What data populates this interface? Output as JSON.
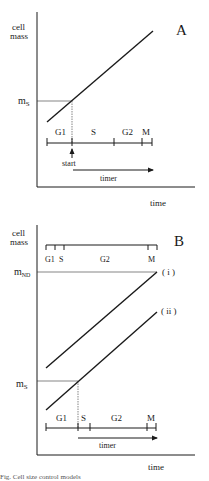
{
  "figure": {
    "panel_a": {
      "label": "A",
      "y_axis_label_line1": "cell",
      "y_axis_label_line2": "mass",
      "x_axis_label": "time",
      "threshold_label": "m",
      "threshold_subscript": "S",
      "phases": [
        "G1",
        "S",
        "G2",
        "M"
      ],
      "start_label": "start",
      "timer_label": "timer"
    },
    "panel_b": {
      "label": "B",
      "y_axis_label_line1": "cell",
      "y_axis_label_line2": "mass",
      "x_axis_label": "time",
      "division_threshold_label": "m",
      "division_threshold_subscript": "ND",
      "start_threshold_label": "m",
      "start_threshold_subscript": "S",
      "top_phases": [
        "G1",
        "S",
        "G2",
        "M"
      ],
      "bottom_phases": [
        "G1",
        "S",
        "G2",
        "M"
      ],
      "curve_i_label": "( i )",
      "curve_ii_label": "( ii )",
      "timer_label": "timer"
    },
    "caption_fragment": "Fig. Cell size control models"
  }
}
